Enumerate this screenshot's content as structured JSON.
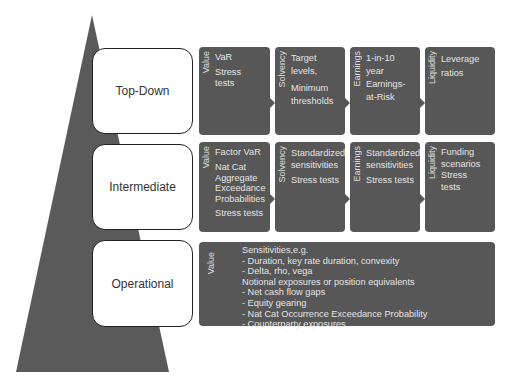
{
  "diagram": {
    "colors": {
      "pyramid": "#5a5a5a",
      "panel": "#575757",
      "panel_text": "#e4e4e4",
      "level_box_border": "#222222"
    },
    "levels": [
      {
        "label": "Top-Down",
        "panels": [
          {
            "category": "Value",
            "items": [
              "VaR",
              "Stress tests"
            ]
          },
          {
            "category": "Solvency",
            "items": [
              "Target levels,",
              "Minimum thresholds"
            ]
          },
          {
            "category": "Earnings",
            "items": [
              "1-in-10 year Earnings-at-Risk"
            ]
          },
          {
            "category": "Liquidity",
            "items": [
              "Leverage ratios"
            ]
          }
        ]
      },
      {
        "label": "Intermediate",
        "panels": [
          {
            "category": "Value",
            "items": [
              "Factor VaR",
              "Nat Cat Aggregate Exceedance Probabilities",
              "Stress tests"
            ]
          },
          {
            "category": "Solvency",
            "items": [
              "Standardized sensitivities",
              "Stress tests"
            ]
          },
          {
            "category": "Earnings",
            "items": [
              "Standardized sensitivities",
              "Stress tests"
            ]
          },
          {
            "category": "Liquidity",
            "items": [
              "Funding scenarios",
              "Stress tests"
            ]
          }
        ]
      },
      {
        "label": "Operational",
        "panels": [
          {
            "category": "Value",
            "items": [
              "Sensitivities,e.g.",
              "- Duration, key rate duration, convexity",
              "- Delta, rho, vega",
              "Notional exposures or position equivalents",
              "- Net cash flow gaps",
              "- Equity gearing",
              "- Nat Cat Occurrence Exceedance Probability",
              "- Counterparty exposures"
            ]
          }
        ]
      }
    ]
  }
}
